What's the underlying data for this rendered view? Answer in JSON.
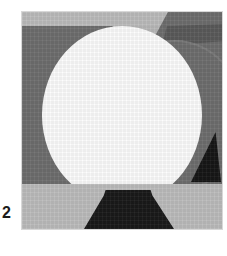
{
  "panel": {
    "index_label": "2",
    "caption": ""
  },
  "image": {
    "alt_name": "quantized-grayscale-sphere-scene",
    "width": 200,
    "height": 217,
    "left": 22,
    "top": 12
  },
  "palette": {
    "white": "#fdfdfd",
    "light_gray": "#bdbdbd",
    "plate_gray": "#b9b9b9",
    "mid_gray": "#6e6e6e",
    "rim_gray": "#7c7c7c",
    "dark_gray": "#5b5b5b",
    "near_black": "#1a1a1a",
    "triangle_black": "#171717",
    "page_background": "#ffffff"
  },
  "regions": [
    {
      "name": "top-band",
      "label": "upper light band",
      "color": "#bdbdbd"
    },
    {
      "name": "left-wedge",
      "label": "left mid-gray wedge",
      "color": "#6e6e6e"
    },
    {
      "name": "right-wedge",
      "label": "right mid-gray wedge",
      "color": "#6e6e6e"
    },
    {
      "name": "dark-strip",
      "label": "upper-right dark strip",
      "color": "#5b5b5b"
    },
    {
      "name": "gray-sphere",
      "label": "gray sphere",
      "color": "#6e6e6e"
    },
    {
      "name": "gray-sphere-rim",
      "label": "gray sphere rim",
      "color": "#7c7c7c"
    },
    {
      "name": "white-sphere",
      "label": "white sphere",
      "color": "#fdfdfd"
    },
    {
      "name": "floor",
      "label": "lower light plate",
      "color": "#bdbdbd"
    },
    {
      "name": "pedestal",
      "label": "bottom dark trapezoid",
      "color": "#1a1a1a"
    },
    {
      "name": "right-triangle",
      "label": "right dark triangle",
      "color": "#171717"
    }
  ]
}
